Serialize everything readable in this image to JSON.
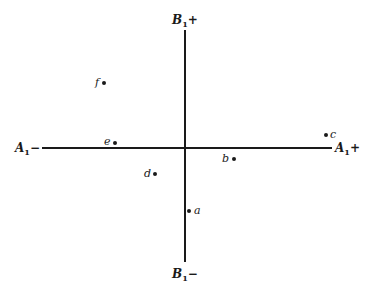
{
  "axes": {
    "b_plus": {
      "name": "B",
      "sub": "1",
      "sign": "+"
    },
    "b_minus": {
      "name": "B",
      "sub": "1",
      "sign": "−"
    },
    "a_minus": {
      "name": "A",
      "sub": "1",
      "sign": "−"
    },
    "a_plus": {
      "name": "A",
      "sub": "1",
      "sign": "+"
    }
  },
  "points": [
    {
      "id": "a",
      "label": "a"
    },
    {
      "id": "b",
      "label": "b"
    },
    {
      "id": "c",
      "label": "c"
    },
    {
      "id": "d",
      "label": "d"
    },
    {
      "id": "e",
      "label": "e"
    },
    {
      "id": "f",
      "label": "f"
    }
  ]
}
